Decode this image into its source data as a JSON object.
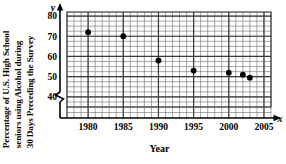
{
  "chart_data": {
    "type": "scatter",
    "title": "",
    "ylabel_lines": [
      "Percentage of U.S. High School",
      "seniors using Alcohol during",
      "30 Days Preceding the Survey"
    ],
    "ylabel": "Percentage of U.S. High School seniors using Alcohol during 30 Days Preceding the Survey",
    "xlabel": "Year",
    "x_axis_variable": "x",
    "y_axis_variable": "y",
    "x": [
      1980,
      1985,
      1990,
      1995,
      2000,
      2002,
      2003
    ],
    "values": [
      72,
      70,
      58,
      53,
      52,
      51,
      49.5
    ],
    "points": [
      {
        "x": 1980,
        "y": 72
      },
      {
        "x": 1985,
        "y": 70
      },
      {
        "x": 1990,
        "y": 58
      },
      {
        "x": 1995,
        "y": 53
      },
      {
        "x": 2000,
        "y": 52
      },
      {
        "x": 2002,
        "y": 51
      },
      {
        "x": 2003,
        "y": 49.5
      }
    ],
    "xticks": [
      1980,
      1985,
      1990,
      1995,
      2000,
      2005
    ],
    "xtick_labels": [
      "1980",
      "1985",
      "1990",
      "1995",
      "2000",
      "2005"
    ],
    "yticks": [
      40,
      50,
      60,
      70,
      80
    ],
    "ytick_labels": [
      "40",
      "50",
      "60",
      "70",
      "80"
    ],
    "xlim": [
      1977,
      2006
    ],
    "ylim": [
      35,
      82
    ],
    "grid": true,
    "grid_minor": true,
    "y_axis_break": true,
    "legend": "none",
    "marker_color": "#000000",
    "grid_color": "#3a3a3a",
    "axis_color": "#000000"
  }
}
